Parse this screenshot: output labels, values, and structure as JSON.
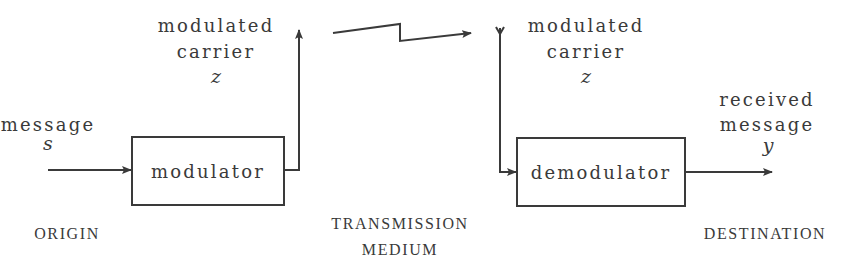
{
  "diagram": {
    "origin": {
      "section_label": "ORIGIN",
      "input": {
        "label": "message",
        "symbol": "s"
      },
      "block": "modulator",
      "output": {
        "label_line1": "modulated",
        "label_line2": "carrier",
        "symbol": "z"
      }
    },
    "medium": {
      "section_label_line1": "TRANSMISSION",
      "section_label_line2": "MEDIUM"
    },
    "destination": {
      "section_label": "DESTINATION",
      "input": {
        "label_line1": "modulated",
        "label_line2": "carrier",
        "symbol": "z"
      },
      "block": "demodulator",
      "output": {
        "label_line1": "received",
        "label_line2": "message",
        "symbol": "y"
      }
    },
    "stroke_color": "#3a3a3a"
  }
}
